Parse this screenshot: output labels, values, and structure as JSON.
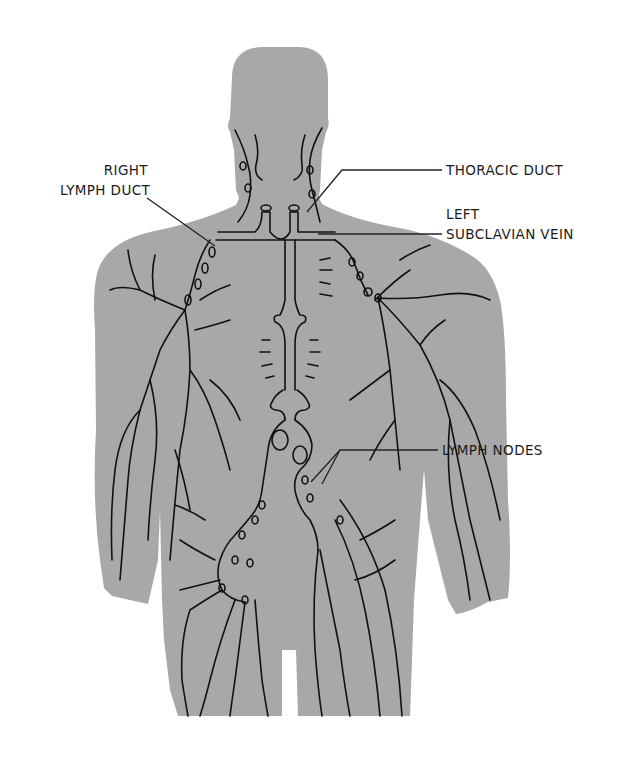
{
  "diagram": {
    "colors": {
      "background": "#ffffff",
      "body_fill": "#a8a8a8",
      "vessel_stroke": "#111111",
      "label_text": "#1a1a1a",
      "leader_line": "#222222"
    },
    "labels": {
      "right_lymph_duct": {
        "line1": "RIGHT",
        "line2": "LYMPH DUCT"
      },
      "thoracic_duct": {
        "line1": "THORACIC DUCT"
      },
      "left_subclavian_vein": {
        "line1": "LEFT",
        "line2": "SUBCLAVIAN VEIN"
      },
      "lymph_nodes": {
        "line1": "LYMPH NODES"
      }
    }
  }
}
